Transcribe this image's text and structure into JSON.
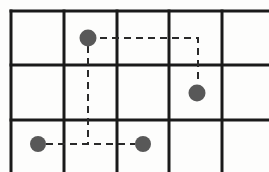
{
  "figure": {
    "width": 269,
    "height": 172,
    "background_color": "#fdfdfc"
  },
  "grid": {
    "line_color": "#1a1a1a",
    "line_width": 3,
    "vertical_lines_x": [
      11,
      64,
      117,
      169,
      222
    ],
    "horizontal_lines_y": [
      11,
      65,
      120
    ],
    "columns": 5,
    "rows": 3,
    "right_edge_open": true,
    "bottom_edge_open": true
  },
  "nodes": [
    {
      "id": "A",
      "label": "node-a",
      "cx": 88,
      "cy": 38,
      "r": 8.5,
      "color": "#585858",
      "cell": "r1c2"
    },
    {
      "id": "B",
      "label": "node-b",
      "cx": 197,
      "cy": 93,
      "r": 8.5,
      "color": "#585858",
      "cell": "r2c4"
    },
    {
      "id": "C",
      "label": "node-c",
      "cx": 38,
      "cy": 144,
      "r": 8.0,
      "color": "#585858",
      "cell": "r3c1"
    },
    {
      "id": "D",
      "label": "node-d",
      "cx": 143,
      "cy": 144,
      "r": 8.0,
      "color": "#585858",
      "cell": "r3c3"
    }
  ],
  "paths": [
    {
      "id": "path-a-to-b",
      "label": "dashed-route-a-b",
      "from": "A",
      "to": "B",
      "style": "dashed",
      "color": "#2a2a2a",
      "width": 2,
      "dash_pattern": "7,5",
      "points": [
        [
          88,
          38
        ],
        [
          198,
          38
        ],
        [
          198,
          84
        ]
      ]
    },
    {
      "id": "path-a-to-cd",
      "label": "dashed-route-a-down",
      "from": "A",
      "to": "CD-line",
      "style": "dashed",
      "color": "#2a2a2a",
      "width": 2,
      "dash_pattern": "7,5",
      "points": [
        [
          88,
          46
        ],
        [
          88,
          144
        ]
      ]
    },
    {
      "id": "path-c-to-d",
      "label": "dashed-route-c-d",
      "from": "C",
      "to": "D",
      "style": "dashed",
      "color": "#2a2a2a",
      "width": 2,
      "dash_pattern": "7,5",
      "points": [
        [
          46,
          144
        ],
        [
          135,
          144
        ]
      ]
    }
  ]
}
